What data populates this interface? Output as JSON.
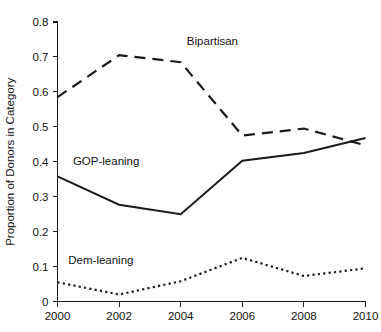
{
  "chart_data": {
    "type": "line",
    "title": "",
    "subtitle": "",
    "xlabel": "",
    "ylabel": "Proportion of Donors in Category",
    "x": [
      2000,
      2002,
      2004,
      2006,
      2008,
      2010
    ],
    "xtick_labels": [
      "2000",
      "2002",
      "2004",
      "2006",
      "2008",
      "2010"
    ],
    "ytick_labels": [
      "0",
      "0.1",
      "0.2",
      "0.3",
      "0.4",
      "0.5",
      "0.6",
      "0.7",
      "0.8"
    ],
    "ytick_values": [
      0,
      0.1,
      0.2,
      0.3,
      0.4,
      0.5,
      0.6,
      0.7,
      0.8
    ],
    "xlim": [
      2000,
      2010
    ],
    "ylim": [
      0,
      0.8
    ],
    "grid": false,
    "legend_position": "inline-annotations",
    "series": [
      {
        "name": "Bipartisan",
        "style": "dashed",
        "color": "#1a1a1a",
        "values": [
          0.585,
          0.705,
          0.685,
          0.475,
          0.495,
          0.447
        ],
        "label_x": 2004.2,
        "label_y": 0.735
      },
      {
        "name": "GOP-leaning",
        "style": "solid",
        "color": "#1a1a1a",
        "values": [
          0.358,
          0.277,
          0.25,
          0.403,
          0.425,
          0.468
        ],
        "label_x": 2000.5,
        "label_y": 0.392
      },
      {
        "name": "Dem-leaning",
        "style": "dotted",
        "color": "#1a1a1a",
        "values": [
          0.055,
          0.02,
          0.058,
          0.125,
          0.073,
          0.095
        ],
        "label_x": 2000.35,
        "label_y": 0.108
      }
    ]
  }
}
